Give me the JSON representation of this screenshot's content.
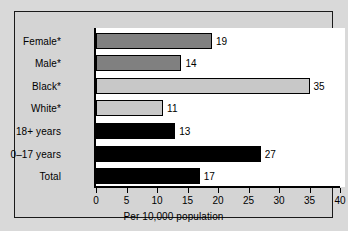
{
  "chart_data": {
    "type": "bar",
    "orientation": "horizontal",
    "title": "",
    "xlabel": "Per 10,000 population",
    "ylabel": "",
    "xlim": [
      0,
      40
    ],
    "xticks": [
      0,
      5,
      10,
      15,
      20,
      25,
      30,
      35,
      40
    ],
    "grid": false,
    "legend": null,
    "categories": [
      "Female*",
      "Male*",
      "Black*",
      "White*",
      "18+ years",
      "0–17 years",
      "Total"
    ],
    "values": [
      19,
      14,
      35,
      11,
      13,
      27,
      17
    ],
    "value_labels": [
      "19",
      "14",
      "35",
      "11",
      "13",
      "27",
      "17"
    ],
    "bar_colors": [
      "#808080",
      "#808080",
      "#c8c8c8",
      "#c8c8c8",
      "#000000",
      "#000000",
      "#000000"
    ],
    "bar_edge_color": "#000000",
    "groups": [
      {
        "name": "sex",
        "categories": [
          "Female*",
          "Male*"
        ],
        "color": "#808080"
      },
      {
        "name": "race",
        "categories": [
          "Black*",
          "White*"
        ],
        "color": "#c8c8c8"
      },
      {
        "name": "age",
        "categories": [
          "18+ years",
          "0–17 years",
          "Total"
        ],
        "color": "#000000"
      }
    ]
  },
  "figure": {
    "background_color": "#d4d4d4",
    "page_background_color": "#d9d9d9",
    "plot_background_color": "#ffffff",
    "frame_color": "#1a1a1a",
    "axis_color": "#000000"
  }
}
